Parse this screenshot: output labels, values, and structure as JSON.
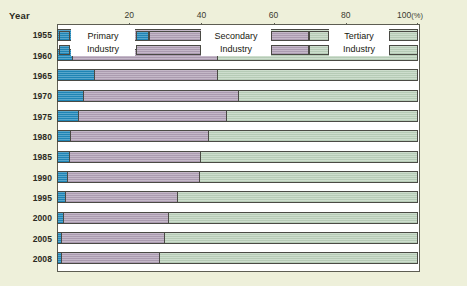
{
  "axis": {
    "year_title": "Year",
    "ticks": [
      {
        "value": 20,
        "label": "20"
      },
      {
        "value": 40,
        "label": "40"
      },
      {
        "value": 60,
        "label": "60"
      },
      {
        "value": 80,
        "label": "80"
      },
      {
        "value": 100,
        "label": "100"
      }
    ],
    "percent_suffix": "(%)"
  },
  "legend": [
    {
      "name": "primary",
      "line1": "Primary",
      "line2": "Industry",
      "color": "#2089bb"
    },
    {
      "name": "secondary",
      "line1": "Secondary",
      "line2": "Industry",
      "color": "#b2a1b7"
    },
    {
      "name": "tertiary",
      "line1": "Tertiary",
      "line2": "Industry",
      "color": "#bdd3bd"
    }
  ],
  "years": [
    "1955",
    "1960",
    "1965",
    "1970",
    "1975",
    "1980",
    "1985",
    "1990",
    "1995",
    "2000",
    "2005",
    "2008"
  ],
  "chart_data": {
    "type": "bar",
    "orientation": "horizontal",
    "stacked": true,
    "normalized": true,
    "title": "",
    "xlabel": "(%)",
    "ylabel": "Year",
    "xlim": [
      0,
      100
    ],
    "grid": false,
    "legend_position": "overlay-top-rows",
    "categories": [
      "1955",
      "1960",
      "1965",
      "1970",
      "1975",
      "1980",
      "1985",
      "1990",
      "1995",
      "2000",
      "2005",
      "2008"
    ],
    "series": [
      {
        "name": "Primary Industry",
        "color": "#2089bb",
        "values": [
          5.0,
          4.5,
          10.5,
          7.5,
          6.0,
          4.0,
          3.5,
          3.0,
          2.5,
          2.0,
          1.5,
          1.5
        ]
      },
      {
        "name": "Secondary Industry",
        "color": "#b2a1b7",
        "values": [
          36.0,
          40.0,
          34.0,
          43.0,
          41.0,
          38.0,
          36.5,
          36.5,
          31.0,
          29.0,
          28.5,
          27.0
        ]
      },
      {
        "name": "Tertiary Industry",
        "color": "#bdd3bd",
        "values": [
          59.0,
          55.5,
          55.5,
          49.5,
          53.0,
          58.0,
          60.0,
          60.5,
          66.5,
          69.0,
          70.0,
          71.5
        ]
      }
    ]
  }
}
